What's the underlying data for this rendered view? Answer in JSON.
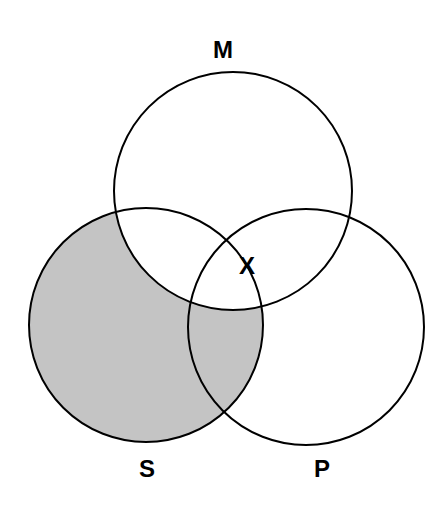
{
  "diagram": {
    "type": "venn",
    "circles": [
      {
        "id": "M",
        "label": "M",
        "cx": 233,
        "cy": 191,
        "r": 119
      },
      {
        "id": "S",
        "label": "S",
        "cx": 146,
        "cy": 325,
        "r": 117
      },
      {
        "id": "P",
        "label": "P",
        "cx": 306,
        "cy": 327,
        "r": 118
      }
    ],
    "shaded_region": "S minus M",
    "shade_color": "#c4c4c4",
    "stroke_color": "#000000",
    "marker": {
      "label": "X",
      "region": "M ∩ P (outside S, on S border)"
    },
    "labels": {
      "M": "M",
      "S": "S",
      "P": "P",
      "X": "X"
    }
  }
}
